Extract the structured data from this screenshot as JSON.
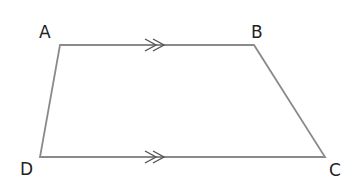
{
  "diagram": {
    "type": "trapezium",
    "stroke_color": "#8a8a8a",
    "label_color": "#222222",
    "vertices": [
      {
        "name": "A",
        "x": 60,
        "y": 45,
        "label_x": 39,
        "label_y": 38
      },
      {
        "name": "B",
        "x": 254,
        "y": 45,
        "label_x": 251,
        "label_y": 38
      },
      {
        "name": "C",
        "x": 325,
        "y": 157,
        "label_x": 329,
        "label_y": 176
      },
      {
        "name": "D",
        "x": 40,
        "y": 157,
        "label_x": 20,
        "label_y": 175
      }
    ],
    "parallel_markers": [
      {
        "side": "AB",
        "style": "double-chevron"
      },
      {
        "side": "DC",
        "style": "double-chevron"
      }
    ]
  }
}
